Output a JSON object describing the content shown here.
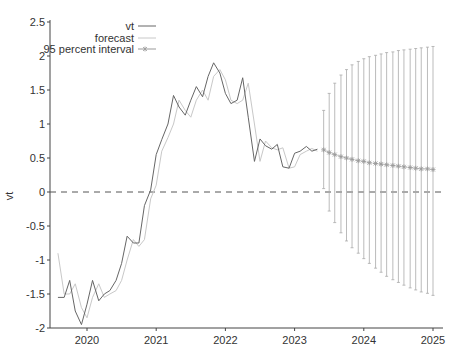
{
  "chart_data": {
    "type": "line",
    "title": "",
    "xlabel": "",
    "ylabel": "vt",
    "xlim": [
      2019.55,
      2025.05
    ],
    "ylim": [
      -2,
      2.5
    ],
    "grid": false,
    "legend_position": "upper-left-inside",
    "x_ticks": [
      2020,
      2021,
      2022,
      2023,
      2024,
      2025
    ],
    "y_ticks": [
      -2,
      -1.5,
      -1,
      -0.5,
      0,
      0.5,
      1,
      1.5,
      2,
      2.5
    ],
    "y_tick_labels": [
      "-2",
      "-1.5",
      "-1",
      "-0.5",
      "0",
      "0.5",
      "1",
      "1.5",
      "2",
      "2.5"
    ],
    "x_tick_labels": [
      "2020",
      "2021",
      "2022",
      "2023",
      "2024",
      "2025"
    ],
    "legend": [
      "vt",
      "forecast",
      "95 percent interval"
    ],
    "reference_line": {
      "y": 0,
      "style": "dashed"
    },
    "series": [
      {
        "name": "vt",
        "color": "#666666",
        "x": [
          2019.58,
          2019.67,
          2019.75,
          2019.83,
          2019.92,
          2020.0,
          2020.08,
          2020.17,
          2020.25,
          2020.33,
          2020.42,
          2020.5,
          2020.58,
          2020.67,
          2020.75,
          2020.83,
          2020.92,
          2021.0,
          2021.08,
          2021.17,
          2021.25,
          2021.33,
          2021.42,
          2021.5,
          2021.58,
          2021.67,
          2021.75,
          2021.83,
          2021.92,
          2022.0,
          2022.08,
          2022.17,
          2022.25,
          2022.33,
          2022.42,
          2022.5,
          2022.58,
          2022.67,
          2022.75,
          2022.83,
          2022.92,
          2023.0,
          2023.08,
          2023.17,
          2023.25,
          2023.33
        ],
        "values": [
          -1.55,
          -1.55,
          -1.3,
          -1.75,
          -1.95,
          -1.65,
          -1.3,
          -1.6,
          -1.5,
          -1.45,
          -1.3,
          -1.05,
          -0.65,
          -0.75,
          -0.75,
          -0.2,
          0.03,
          0.55,
          0.77,
          1.0,
          1.42,
          1.25,
          1.13,
          1.35,
          1.55,
          1.4,
          1.7,
          1.9,
          1.75,
          1.45,
          1.3,
          1.35,
          1.68,
          1.1,
          0.45,
          0.78,
          0.68,
          0.63,
          0.7,
          0.37,
          0.35,
          0.57,
          0.6,
          0.67,
          0.6,
          0.63
        ]
      },
      {
        "name": "forecast",
        "color": "#c8c8c8",
        "x": [
          2019.58,
          2019.67,
          2019.75,
          2019.83,
          2019.92,
          2020.0,
          2020.08,
          2020.17,
          2020.25,
          2020.33,
          2020.42,
          2020.5,
          2020.58,
          2020.67,
          2020.75,
          2020.83,
          2020.92,
          2021.0,
          2021.08,
          2021.17,
          2021.25,
          2021.33,
          2021.42,
          2021.5,
          2021.58,
          2021.67,
          2021.75,
          2021.83,
          2021.92,
          2022.0,
          2022.08,
          2022.17,
          2022.25,
          2022.33,
          2022.42,
          2022.5,
          2022.58,
          2022.67,
          2022.75,
          2022.83,
          2022.92,
          2023.0,
          2023.08,
          2023.17,
          2023.25,
          2023.33
        ],
        "values": [
          -0.9,
          -1.5,
          -1.5,
          -1.35,
          -1.7,
          -1.85,
          -1.55,
          -1.35,
          -1.55,
          -1.5,
          -1.45,
          -1.3,
          -1.0,
          -0.7,
          -0.8,
          -0.7,
          -0.1,
          0.1,
          0.6,
          0.8,
          1.0,
          1.35,
          1.2,
          1.1,
          1.35,
          1.5,
          1.35,
          1.7,
          1.8,
          1.65,
          1.35,
          1.3,
          1.35,
          1.6,
          1.0,
          0.45,
          0.75,
          0.65,
          0.62,
          0.65,
          0.35,
          0.37,
          0.55,
          0.6,
          0.64,
          0.6
        ]
      },
      {
        "name": "95 percent interval",
        "color": "#999999",
        "x": [
          2023.42,
          2023.5,
          2023.58,
          2023.67,
          2023.75,
          2023.83,
          2023.92,
          2024.0,
          2024.08,
          2024.17,
          2024.25,
          2024.33,
          2024.42,
          2024.5,
          2024.58,
          2024.67,
          2024.75,
          2024.83,
          2024.92,
          2025.0
        ],
        "values": [
          0.62,
          0.58,
          0.55,
          0.52,
          0.5,
          0.48,
          0.46,
          0.45,
          0.43,
          0.42,
          0.41,
          0.4,
          0.39,
          0.38,
          0.37,
          0.36,
          0.35,
          0.34,
          0.34,
          0.33
        ],
        "upper": [
          1.2,
          1.45,
          1.6,
          1.72,
          1.8,
          1.87,
          1.92,
          1.96,
          1.99,
          2.01,
          2.03,
          2.05,
          2.06,
          2.08,
          2.09,
          2.1,
          2.11,
          2.12,
          2.13,
          2.14
        ],
        "lower": [
          0.05,
          -0.28,
          -0.45,
          -0.6,
          -0.72,
          -0.82,
          -0.9,
          -0.98,
          -1.05,
          -1.12,
          -1.18,
          -1.24,
          -1.29,
          -1.33,
          -1.37,
          -1.41,
          -1.44,
          -1.47,
          -1.49,
          -1.52
        ]
      }
    ]
  }
}
